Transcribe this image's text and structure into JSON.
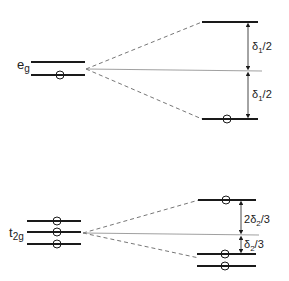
{
  "colors": {
    "line": "#1a1a1a",
    "thin": "#888888",
    "background": "#ffffff"
  },
  "eg": {
    "label": "e",
    "sub": "g",
    "split_upper_label": {
      "delta": "δ",
      "sub": "1",
      "frac": "/2"
    },
    "split_lower_label": {
      "delta": "δ",
      "sub": "1",
      "frac": "/2"
    }
  },
  "t2g": {
    "label": "t",
    "sub": "2g",
    "split_upper_label": {
      "coef": "2",
      "delta": "δ",
      "sub": "2",
      "frac": "/3"
    },
    "split_lower_label": {
      "delta": "δ",
      "sub": "2",
      "frac": "/3"
    }
  }
}
